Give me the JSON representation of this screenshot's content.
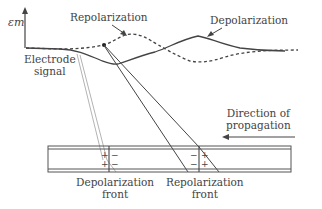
{
  "diagram": {
    "axis_label": "εm",
    "labels": {
      "repolarization": "Repolarization",
      "depolarization": "Depolarization",
      "electrode_signal_line1": "Electrode",
      "electrode_signal_line2": "signal",
      "direction_line1": "Direction of",
      "direction_line2": "propagation",
      "depol_front_line1": "Depolarization",
      "depol_front_line2": "front",
      "repol_front_line1": "Repolarization",
      "repol_front_line2": "front"
    },
    "charges": {
      "plus": "+",
      "minus": "−"
    },
    "colors": {
      "line": "#444444",
      "light_line": "#aaaaaa",
      "text": "#444444"
    }
  }
}
